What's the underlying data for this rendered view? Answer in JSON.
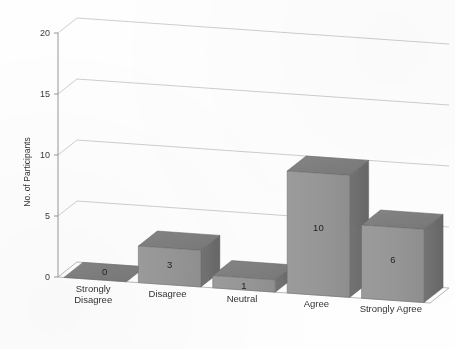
{
  "chart_data": {
    "type": "bar",
    "title": "",
    "subtitle": "",
    "xlabel": "",
    "ylabel": "No. of Participants",
    "categories": [
      "Strongly Disagree",
      "Disagree",
      "Neutral",
      "Agree",
      "Strongly Agree"
    ],
    "values": [
      0,
      3,
      1,
      10,
      6
    ],
    "data_labels": [
      "0",
      "3",
      "1",
      "10",
      "6"
    ],
    "ylim": [
      0,
      20
    ],
    "y_ticks": [
      "0",
      "5",
      "10",
      "15",
      "20"
    ],
    "y_tick_values": [
      0,
      5,
      10,
      15,
      20
    ],
    "grid": true,
    "legend": "none",
    "three_d": true,
    "series": [
      {
        "name": "No. of Participants",
        "values": [
          0,
          3,
          1,
          10,
          6
        ]
      }
    ]
  },
  "style": {
    "bar_front_color": "#989898",
    "bar_side_color": "#6d6d6d",
    "bar_top_color": "#7e7e7e",
    "gridline_color": "#b9b9b9",
    "axis_color": "#8d8d8d",
    "background_color": "#fefefe",
    "text_color": "#333333"
  },
  "axis": {
    "y_title": "No. of Participants"
  },
  "categories_wrapped": [
    [
      "Strongly",
      "Disagree"
    ],
    [
      "Disagree"
    ],
    [
      "Neutral"
    ],
    [
      "Agree"
    ],
    [
      "Strongly Agree"
    ]
  ]
}
